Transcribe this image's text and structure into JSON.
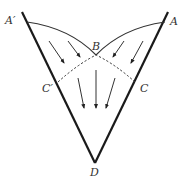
{
  "diagram": {
    "labels": {
      "a_prime": "A′",
      "a": "A",
      "b": "B",
      "c_prime": "C′",
      "c": "C",
      "d": "D"
    },
    "colors": {
      "walls": "#1a1a1a",
      "curves": "#333333",
      "arrows": "#333333",
      "text": "#333333"
    }
  }
}
